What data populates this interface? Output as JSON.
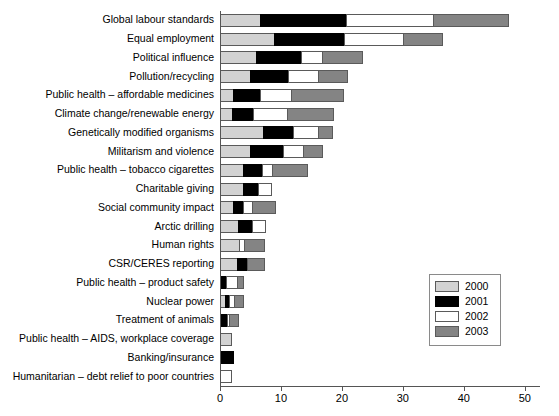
{
  "chart_data": {
    "type": "bar",
    "orientation": "horizontal",
    "stacked": true,
    "title": "",
    "xlabel": "",
    "ylabel": "",
    "xlim": [
      0,
      52.5
    ],
    "grid": false,
    "legend_position": "right-lower",
    "axis_ticks": [
      0,
      10,
      20,
      30,
      40,
      50
    ],
    "series": [
      {
        "name": "2000",
        "color": "#d2d2d2",
        "values": [
          6.6,
          8.9,
          5.9,
          4.9,
          2.1,
          2.0,
          7.0,
          4.9,
          3.8,
          3.8,
          2.1,
          3.0,
          3.1,
          2.8,
          0.0,
          0.8,
          0.0,
          1.8,
          0.0,
          0.0
        ]
      },
      {
        "name": "2001",
        "color": "#000000",
        "values": [
          14.0,
          11.5,
          7.4,
          6.2,
          4.4,
          3.4,
          4.9,
          5.4,
          3.1,
          2.5,
          1.6,
          2.3,
          0.0,
          1.6,
          1.0,
          0.7,
          1.1,
          0.0,
          2.1,
          0.0
        ]
      },
      {
        "name": "2002",
        "color": "#ffffff",
        "values": [
          14.4,
          9.7,
          3.4,
          4.9,
          5.2,
          5.6,
          4.1,
          3.4,
          1.6,
          2.0,
          1.5,
          2.1,
          0.9,
          0.0,
          1.8,
          0.8,
          0.4,
          0.0,
          0.0,
          1.8
        ]
      },
      {
        "name": "2003",
        "color": "#848484",
        "values": [
          12.3,
          6.4,
          6.6,
          4.9,
          8.5,
          7.5,
          2.3,
          3.0,
          5.7,
          0.0,
          3.8,
          0.0,
          3.3,
          2.8,
          1.0,
          1.5,
          1.5,
          0.0,
          0.0,
          0.0
        ]
      }
    ],
    "categories": [
      "Global labour standards",
      "Equal employment",
      "Political influence",
      "Pollution/recycling",
      "Public health – affordable medicines",
      "Climate change/renewable energy",
      "Genetically modified organisms",
      "Militarism and violence",
      "Public health – tobacco cigarettes",
      "Charitable giving",
      "Social community impact",
      "Arctic drilling",
      "Human rights",
      "CSR/CERES reporting",
      "Public health – product safety",
      "Nuclear power",
      "Treatment of animals",
      "Public health – AIDS, workplace coverage",
      "Banking/insurance",
      "Humanitarian – debt relief to poor countries"
    ],
    "totals": [
      47.3,
      36.5,
      23.3,
      20.9,
      20.2,
      18.5,
      18.3,
      16.7,
      14.2,
      8.3,
      9.0,
      7.4,
      7.3,
      7.2,
      3.8,
      3.8,
      3.0,
      1.8,
      2.1,
      1.8
    ]
  },
  "legend": {
    "entries": [
      {
        "label": "2000",
        "color": "#d2d2d2"
      },
      {
        "label": "2001",
        "color": "#000000"
      },
      {
        "label": "2002",
        "color": "#ffffff"
      },
      {
        "label": "2003",
        "color": "#848484"
      }
    ]
  }
}
